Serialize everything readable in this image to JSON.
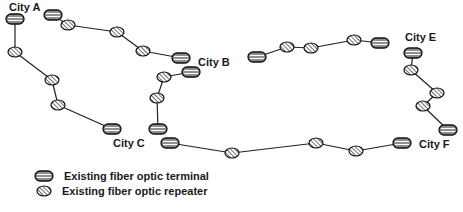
{
  "colors": {
    "line": "#222222",
    "terminal_fill": "#8a8a8a",
    "terminal_stripe": "#ffffff",
    "repeater_fill": "#ffffff",
    "repeater_hatch": "#333333",
    "outline": "#111111",
    "text": "#1a1a1a"
  },
  "cities": [
    {
      "id": "A",
      "label": "City A",
      "x": 9,
      "y": 11
    },
    {
      "id": "B",
      "label": "City B",
      "x": 198,
      "y": 66
    },
    {
      "id": "C",
      "label": "City C",
      "x": 113,
      "y": 147
    },
    {
      "id": "E",
      "label": "City E",
      "x": 405,
      "y": 41
    },
    {
      "id": "F",
      "label": "City F",
      "x": 419,
      "y": 148
    }
  ],
  "chains": [
    {
      "name": "city-a-to-city-b",
      "nodes": [
        {
          "type": "terminal",
          "x": 53,
          "y": 15
        },
        {
          "type": "repeater",
          "x": 68,
          "y": 25
        },
        {
          "type": "repeater",
          "x": 117,
          "y": 32
        },
        {
          "type": "repeater",
          "x": 143,
          "y": 51
        },
        {
          "type": "terminal",
          "x": 181,
          "y": 58
        }
      ]
    },
    {
      "name": "city-a-to-city-c",
      "nodes": [
        {
          "type": "terminal",
          "x": 15,
          "y": 19
        },
        {
          "type": "repeater",
          "x": 15,
          "y": 52
        },
        {
          "type": "repeater",
          "x": 52,
          "y": 80
        },
        {
          "type": "repeater",
          "x": 58,
          "y": 105
        },
        {
          "type": "terminal",
          "x": 112,
          "y": 129
        }
      ]
    },
    {
      "name": "city-b-to-city-c",
      "nodes": [
        {
          "type": "terminal",
          "x": 191,
          "y": 72
        },
        {
          "type": "repeater",
          "x": 164,
          "y": 77
        },
        {
          "type": "repeater",
          "x": 157,
          "y": 98
        },
        {
          "type": "terminal",
          "x": 158,
          "y": 129
        }
      ]
    },
    {
      "name": "b-to-e-segment",
      "nodes": [
        {
          "type": "terminal",
          "x": 257,
          "y": 57
        },
        {
          "type": "repeater",
          "x": 287,
          "y": 47
        },
        {
          "type": "repeater",
          "x": 311,
          "y": 48
        },
        {
          "type": "repeater",
          "x": 354,
          "y": 40
        },
        {
          "type": "terminal",
          "x": 380,
          "y": 43
        }
      ]
    },
    {
      "name": "city-e-to-city-f",
      "nodes": [
        {
          "type": "terminal",
          "x": 413,
          "y": 53
        },
        {
          "type": "repeater",
          "x": 411,
          "y": 70
        },
        {
          "type": "repeater",
          "x": 437,
          "y": 93
        },
        {
          "type": "repeater",
          "x": 423,
          "y": 106
        },
        {
          "type": "terminal",
          "x": 448,
          "y": 130
        }
      ]
    },
    {
      "name": "city-c-to-city-f",
      "nodes": [
        {
          "type": "terminal",
          "x": 170,
          "y": 143
        },
        {
          "type": "repeater",
          "x": 232,
          "y": 153
        },
        {
          "type": "repeater",
          "x": 316,
          "y": 143
        },
        {
          "type": "repeater",
          "x": 356,
          "y": 151
        },
        {
          "type": "terminal",
          "x": 402,
          "y": 143
        }
      ]
    }
  ],
  "legend": {
    "items": [
      {
        "symbol": "terminal",
        "label": "Existing fiber optic terminal",
        "sym_x": 44,
        "sym_y": 176,
        "text_x": 64,
        "text_y": 180
      },
      {
        "symbol": "repeater",
        "label": "Existing fiber optic repeater",
        "sym_x": 44,
        "sym_y": 191,
        "text_x": 62,
        "text_y": 195
      }
    ]
  }
}
